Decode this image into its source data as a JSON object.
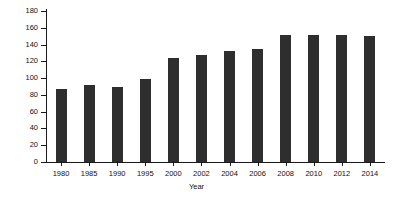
{
  "chart_data": {
    "type": "bar",
    "title": "",
    "xlabel": "Year",
    "ylabel": "Rate per 100,000 population",
    "categories": [
      "1980",
      "1985",
      "1990",
      "1995",
      "2000",
      "2002",
      "2004",
      "2006",
      "2008",
      "2010",
      "2012",
      "2014"
    ],
    "values": [
      87,
      92,
      89,
      99,
      124,
      128,
      132,
      135,
      152,
      152,
      152,
      150
    ],
    "ylim": [
      0,
      180
    ],
    "yticks": [
      0,
      20,
      40,
      60,
      80,
      100,
      120,
      140,
      160,
      180
    ],
    "ytick_labels": [
      "0",
      "20",
      "40",
      "60",
      "80",
      "100",
      "120",
      "140",
      "160",
      "180"
    ],
    "grid": false,
    "legend": null,
    "bar_color": "#2e2e2e",
    "axis_color": "#1a1a1a",
    "background": "#ffffff"
  }
}
